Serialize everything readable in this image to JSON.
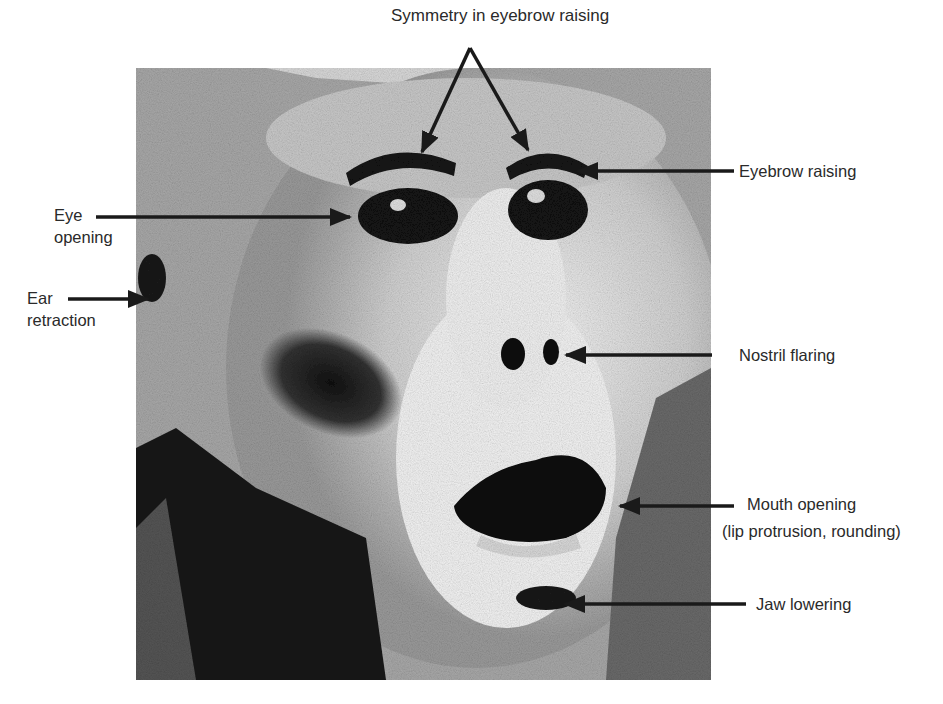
{
  "figure": {
    "labels": {
      "symmetry": "Symmetry in eyebrow raising",
      "eyebrow": "Eyebrow raising",
      "eye_line1": "Eye",
      "eye_line2": "opening",
      "ear_line1": "Ear",
      "ear_line2": "retraction",
      "nostril": "Nostril flaring",
      "mouth_line1": "Mouth opening",
      "mouth_line2": "(lip protrusion, rounding)",
      "jaw": "Jaw lowering"
    },
    "colors": {
      "background": "#ffffff",
      "text": "#2a2a2a",
      "arrow": "#1a1a1a",
      "photo_mid": "#9a9a9a",
      "photo_dark": "#111111",
      "photo_light": "#e8e8e8"
    }
  }
}
